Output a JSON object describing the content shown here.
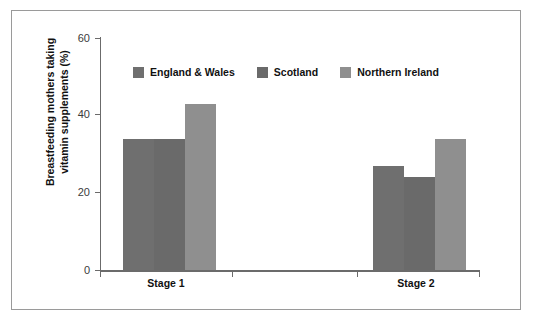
{
  "chart_data": {
    "type": "bar",
    "title": "",
    "xlabel": "",
    "ylabel": "Breastfeeding mothers taking vitamin supplements (%)",
    "ylabel_line1": "Breastfeeding mothers taking",
    "ylabel_line2": "vitamin supplements (%)",
    "categories": [
      "Stage 1",
      "Stage 2"
    ],
    "ylim": [
      0,
      60
    ],
    "yticks": [
      "0",
      "20",
      "40",
      "60"
    ],
    "ytick_values": [
      0,
      20,
      40,
      60
    ],
    "grid": false,
    "legend_position": "top-center",
    "series": [
      {
        "name": "England & Wales",
        "color": "#6f6f6f",
        "values": [
          34,
          27
        ]
      },
      {
        "name": "Scotland",
        "color": "#6a6a6a",
        "values": [
          34,
          24
        ]
      },
      {
        "name": "Northern Ireland",
        "color": "#8f8f8f",
        "values": [
          43,
          34
        ]
      }
    ]
  },
  "colors": {
    "england_wales": "#6f6f6f",
    "scotland": "#6a6a6a",
    "northern_ireland": "#8f8f8f",
    "axis": "#6b6b6b",
    "frame": "#9a9a9a",
    "text": "#111111",
    "tick_text": "#3b3b3b",
    "background": "#ffffff"
  }
}
